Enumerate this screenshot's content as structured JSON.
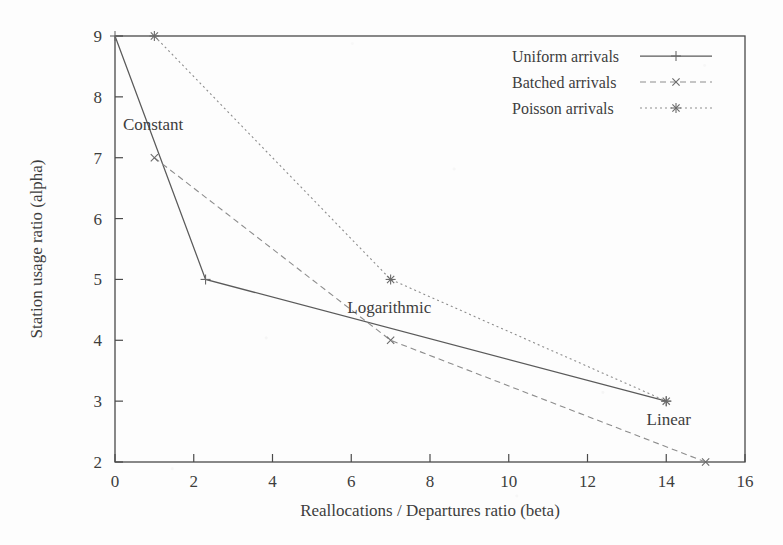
{
  "figure": {
    "background_color": "#fdfdfd",
    "ink_color": "#3d3d3d"
  },
  "chart_data": {
    "type": "line",
    "title": "",
    "xlabel": "Reallocations / Departures ratio (beta)",
    "ylabel": "Station usage ratio (alpha)",
    "xlim": [
      0,
      16
    ],
    "ylim": [
      2,
      9
    ],
    "xticks": [
      0,
      2,
      4,
      6,
      8,
      10,
      12,
      14,
      16
    ],
    "yticks": [
      2,
      3,
      4,
      5,
      6,
      7,
      8,
      9
    ],
    "grid": false,
    "legend_position": "top-right",
    "series": [
      {
        "name": "Uniform arrivals",
        "marker": "plus",
        "linestyle": "solid",
        "color": "#5a5a5a",
        "points": [
          {
            "x": 0,
            "y": 9
          },
          {
            "x": 2.3,
            "y": 5
          },
          {
            "x": 14,
            "y": 3
          }
        ]
      },
      {
        "name": "Batched arrivals",
        "marker": "cross",
        "linestyle": "dashed",
        "color": "#8d8d8d",
        "points": [
          {
            "x": 1,
            "y": 7
          },
          {
            "x": 7,
            "y": 4
          },
          {
            "x": 15,
            "y": 2
          }
        ]
      },
      {
        "name": "Poisson arrivals",
        "marker": "star",
        "linestyle": "dotted",
        "color": "#8d8d8d",
        "points": [
          {
            "x": 1,
            "y": 9
          },
          {
            "x": 7,
            "y": 5
          },
          {
            "x": 14,
            "y": 3
          }
        ]
      }
    ],
    "annotations": [
      {
        "text": "Constant",
        "x": 0.2,
        "y": 7.45
      },
      {
        "text": "Logarithmic",
        "x": 5.9,
        "y": 4.45
      },
      {
        "text": "Linear",
        "x": 13.5,
        "y": 2.6
      }
    ]
  },
  "legend": {
    "entries": [
      {
        "label": "Uniform arrivals"
      },
      {
        "label": "Batched arrivals"
      },
      {
        "label": "Poisson arrivals"
      }
    ]
  },
  "axes": {
    "x_tick_labels": [
      "0",
      "2",
      "4",
      "6",
      "8",
      "10",
      "12",
      "14",
      "16"
    ],
    "y_tick_labels": [
      "2",
      "3",
      "4",
      "5",
      "6",
      "7",
      "8",
      "9"
    ],
    "x_title": "Reallocations / Departures ratio (beta)",
    "y_title": "Station usage ratio (alpha)"
  }
}
